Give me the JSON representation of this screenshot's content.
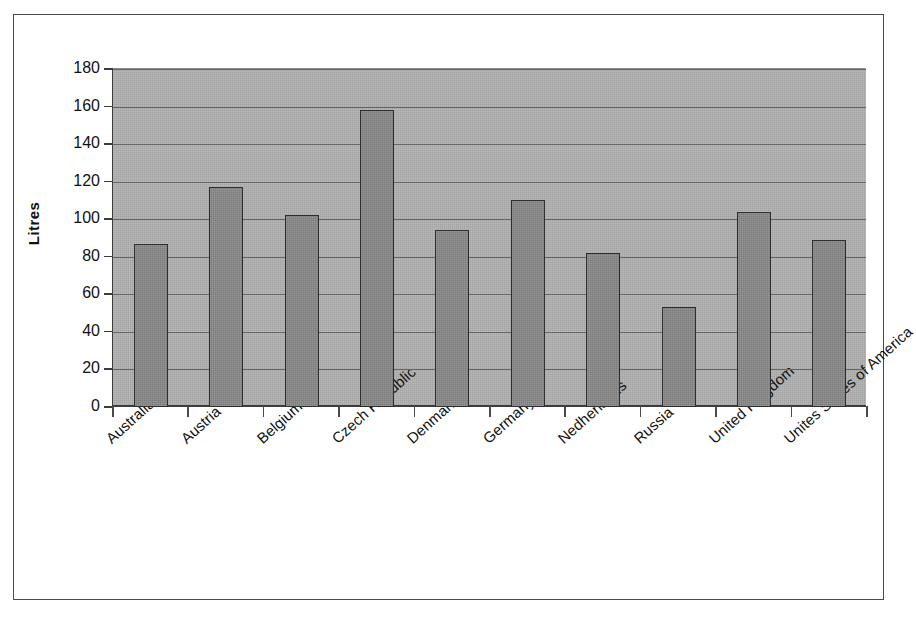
{
  "chart_data": {
    "type": "bar",
    "title": "",
    "xlabel": "",
    "ylabel": "Litres",
    "ylim": [
      0,
      180
    ],
    "ytick_step": 20,
    "yticks": [
      180,
      160,
      140,
      120,
      100,
      80,
      60,
      40,
      20,
      0
    ],
    "grid": true,
    "legend": "none",
    "categories": [
      "Australia",
      "Austria",
      "Belgium",
      "Czech Republic",
      "Denmark",
      "Germany",
      "Nedherlands",
      "Russia",
      "United Kingdom",
      "Unites States of America"
    ],
    "values": [
      87,
      117,
      102,
      158,
      94,
      110,
      82,
      53,
      104,
      89
    ],
    "colors": {
      "bar_fill": "#8a8a8a",
      "bar_border": "#2e2e2e",
      "plot_background": "#b0b0b0",
      "gridline": "#666666",
      "axis": "#3c3c3c",
      "frame": "#4a4a4a",
      "text": "#111111",
      "page_background": "#ffffff"
    }
  }
}
